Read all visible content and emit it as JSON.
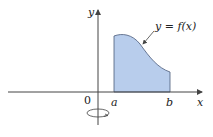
{
  "figure": {
    "curve_label": "y = f(x)",
    "x_axis_label": "x",
    "y_axis_label": "y",
    "origin_label": "0",
    "a_label": "a",
    "b_label": "b",
    "fill_color": "#b8cdec",
    "stroke_color": "#444444",
    "rotation_axis": "y"
  }
}
